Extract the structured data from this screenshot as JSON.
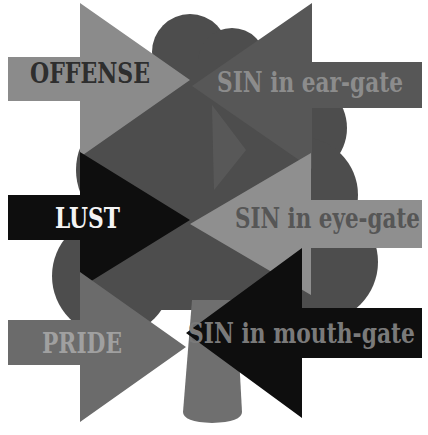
{
  "diagram": {
    "background": "#ffffff",
    "tree": {
      "crown_color": "#4d4d4d",
      "trunk_color": "#6f6f6f"
    },
    "arrows": [
      {
        "label": "OFFENSE",
        "direction": "right",
        "fill": "#8b8b8b",
        "text_color": "#2e2e2e"
      },
      {
        "label": "SIN in ear-gate",
        "direction": "left",
        "fill": "#575757",
        "text_color": "#8c8c8c"
      },
      {
        "label": "LUST",
        "direction": "right",
        "fill": "#0e0e0e",
        "text_color": "#f4f4f4"
      },
      {
        "label": "SIN in eye-gate",
        "direction": "left",
        "fill": "#8f8f8f",
        "text_color": "#565656"
      },
      {
        "label": "PRIDE",
        "direction": "right",
        "fill": "#6b6b6b",
        "text_color": "#a0a0a0"
      },
      {
        "label": "SIN in mouth-gate",
        "direction": "left",
        "fill": "#0e0e0e",
        "text_color": "#7a7a7a"
      }
    ]
  }
}
